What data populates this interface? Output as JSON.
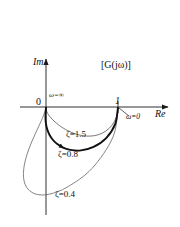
{
  "figure": {
    "title": "[G(jω)]",
    "background": "#ffffff",
    "ink": "#1a1a1a"
  },
  "axes": {
    "imag_label": "Im",
    "real_label": "Re",
    "origin_label": "0",
    "unit_tick_label": "1"
  },
  "annotations": {
    "omega_infinity": "ω=∞",
    "omega_zero": "ω=0"
  },
  "curve_labels": {
    "zeta_15": "ζ=1.5",
    "zeta_08": "ζ=0.8",
    "zeta_04": "ζ=0.4"
  },
  "chart_data": {
    "type": "line",
    "title": "[G(jω)]",
    "xlabel": "Re",
    "ylabel": "Im",
    "grid": false,
    "legend": "inline-annotations",
    "xlim": [
      -0.35,
      1.45
    ],
    "ylim": [
      -1.45,
      0.35
    ],
    "axis_ticks": {
      "x": [
        0,
        1
      ],
      "x_labels": [
        "0",
        "1"
      ],
      "y": [],
      "y_labels": []
    },
    "annotations": [
      {
        "text": "ω=0",
        "x": 1.0,
        "y": 0.0,
        "placement": "lower-right-of-point"
      },
      {
        "text": "ω=∞",
        "x": 0.0,
        "y": 0.0,
        "placement": "upper-right-of-point"
      },
      {
        "text": "[G(jω)]",
        "x": 0.72,
        "y": 0.26,
        "placement": "plane-label"
      }
    ],
    "series": [
      {
        "name": "ζ=1.5",
        "zeta": 1.5,
        "stroke": "#555555",
        "linewidth": 0.8,
        "label_xy": [
          0.37,
          -0.46
        ],
        "extrema": {
          "min_imag": -0.337,
          "min_real": -0.012
        },
        "points": [
          [
            1.0,
            0.0
          ],
          [
            0.978,
            -0.136
          ],
          [
            0.916,
            -0.253
          ],
          [
            0.827,
            -0.337
          ],
          [
            0.724,
            -0.386
          ],
          [
            0.618,
            -0.404
          ],
          [
            0.516,
            -0.399
          ],
          [
            0.423,
            -0.378
          ],
          [
            0.341,
            -0.347
          ],
          [
            0.271,
            -0.312
          ],
          [
            0.213,
            -0.276
          ],
          [
            0.165,
            -0.241
          ],
          [
            0.126,
            -0.208
          ],
          [
            0.095,
            -0.179
          ],
          [
            0.07,
            -0.152
          ],
          [
            0.05,
            -0.128
          ],
          [
            0.035,
            -0.107
          ],
          [
            0.023,
            -0.088
          ],
          [
            0.014,
            -0.07
          ],
          [
            0.007,
            -0.05
          ],
          [
            0.003,
            -0.03
          ],
          [
            0.0,
            0.0
          ]
        ]
      },
      {
        "name": "ζ=0.8",
        "zeta": 0.8,
        "stroke": "#111111",
        "linewidth": 1.9,
        "label_xy": [
          0.28,
          -0.62
        ],
        "extrema": {
          "min_imag": -0.625,
          "min_real": -0.055
        },
        "points": [
          [
            1.0,
            0.0
          ],
          [
            0.962,
            -0.235
          ],
          [
            0.836,
            -0.432
          ],
          [
            0.661,
            -0.555
          ],
          [
            0.486,
            -0.603
          ],
          [
            0.336,
            -0.595
          ],
          [
            0.222,
            -0.556
          ],
          [
            0.141,
            -0.502
          ],
          [
            0.086,
            -0.444
          ],
          [
            0.05,
            -0.388
          ],
          [
            0.026,
            -0.336
          ],
          [
            0.011,
            -0.289
          ],
          [
            0.002,
            -0.247
          ],
          [
            -0.003,
            -0.21
          ],
          [
            -0.006,
            -0.177
          ],
          [
            -0.007,
            -0.148
          ],
          [
            -0.007,
            -0.122
          ],
          [
            -0.006,
            -0.098
          ],
          [
            -0.004,
            -0.074
          ],
          [
            -0.002,
            -0.048
          ],
          [
            -0.001,
            -0.025
          ],
          [
            0.0,
            0.0
          ]
        ]
      },
      {
        "name": "ζ=0.4",
        "zeta": 0.4,
        "stroke": "#666666",
        "linewidth": 0.8,
        "label_xy": [
          0.22,
          -1.08
        ],
        "extrema": {
          "min_imag": -1.25,
          "min_real": -0.31
        },
        "points": [
          [
            1.0,
            0.0
          ],
          [
            0.93,
            -0.418
          ],
          [
            0.64,
            -0.852
          ],
          [
            0.3,
            -1.11
          ],
          [
            0.05,
            -1.21
          ],
          [
            -0.12,
            -1.215
          ],
          [
            -0.23,
            -1.16
          ],
          [
            -0.29,
            -1.075
          ],
          [
            -0.312,
            -0.975
          ],
          [
            -0.31,
            -0.87
          ],
          [
            -0.293,
            -0.765
          ],
          [
            -0.267,
            -0.668
          ],
          [
            -0.237,
            -0.58
          ],
          [
            -0.205,
            -0.5
          ],
          [
            -0.174,
            -0.428
          ],
          [
            -0.145,
            -0.364
          ],
          [
            -0.118,
            -0.306
          ],
          [
            -0.094,
            -0.254
          ],
          [
            -0.072,
            -0.206
          ],
          [
            -0.052,
            -0.16
          ],
          [
            -0.034,
            -0.114
          ],
          [
            -0.017,
            -0.064
          ],
          [
            0.0,
            0.0
          ]
        ]
      }
    ]
  }
}
